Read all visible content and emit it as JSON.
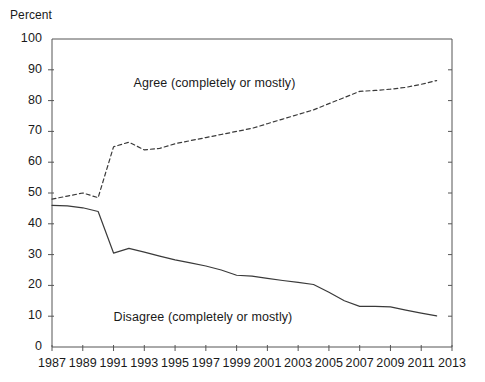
{
  "chart_data": {
    "type": "line",
    "title": "",
    "subtitle": "",
    "xlabel": "",
    "ylabel": "Percent",
    "ylim": [
      0,
      100
    ],
    "xlim": [
      1987,
      2013
    ],
    "grid": false,
    "legend_position": "inline-annotations",
    "y_ticks": [
      "100",
      "90",
      "80",
      "70",
      "60",
      "50",
      "40",
      "30",
      "20",
      "10",
      "0"
    ],
    "y_tick_values": [
      100,
      90,
      80,
      70,
      60,
      50,
      40,
      30,
      20,
      10,
      0
    ],
    "x_ticks": [
      "1987",
      "1989",
      "1991",
      "1993",
      "1995",
      "1997",
      "1999",
      "2001",
      "2003",
      "2005",
      "2007",
      "2009",
      "2011",
      "2013"
    ],
    "x_tick_values": [
      1987,
      1989,
      1991,
      1993,
      1995,
      1997,
      1999,
      2001,
      2003,
      2005,
      2007,
      2009,
      2011,
      2013
    ],
    "series": [
      {
        "name": "Agree (completely or mostly)",
        "style": "dashed",
        "color": "#3a3a3a",
        "x": [
          1987,
          1988,
          1989,
          1990,
          1991,
          1992,
          1993,
          1994,
          1995,
          1996,
          1997,
          1998,
          1999,
          2000,
          2001,
          2002,
          2003,
          2004,
          2005,
          2006,
          2007,
          2008,
          2009,
          2010,
          2011,
          2012
        ],
        "values": [
          48,
          49,
          50,
          48.5,
          65,
          66.5,
          64,
          64.5,
          66,
          67,
          68,
          69,
          70,
          71,
          72.5,
          74,
          75.5,
          77,
          79,
          81,
          83,
          83.3,
          83.7,
          84.3,
          85.3,
          86.5
        ]
      },
      {
        "name": "Disagree (completely or mostly)",
        "style": "solid",
        "color": "#3a3a3a",
        "x": [
          1987,
          1988,
          1989,
          1990,
          1991,
          1992,
          1993,
          1994,
          1995,
          1996,
          1997,
          1998,
          1999,
          2000,
          2001,
          2002,
          2003,
          2004,
          2005,
          2006,
          2007,
          2008,
          2009,
          2010,
          2011,
          2012
        ],
        "values": [
          46,
          45.8,
          45.2,
          44,
          30.5,
          32,
          30.8,
          29.5,
          28.3,
          27.3,
          26.3,
          25,
          23.3,
          23,
          22.3,
          21.6,
          21,
          20.3,
          17.8,
          15,
          13.2,
          13.2,
          13,
          12,
          11,
          10.1
        ]
      }
    ],
    "annotations": [
      {
        "name": "agree-series-label",
        "text": "Agree (completely or mostly)",
        "x": 1992.3,
        "y": 85.5
      },
      {
        "name": "disagree-series-label",
        "text": "Disagree (completely or mostly)",
        "x": 1991.0,
        "y": 9.5
      }
    ],
    "colors": {
      "axis": "#555555",
      "line": "#3a3a3a",
      "text": "#1a1a1a",
      "background": "#ffffff"
    }
  }
}
